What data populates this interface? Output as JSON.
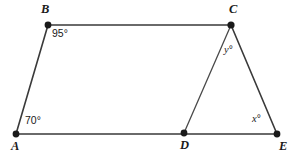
{
  "figure": {
    "background_color": "#ffffff",
    "line_color": "#3a3a3a",
    "vertex_color": "#1a1a1a",
    "width": 293,
    "height": 156
  },
  "vertices": [
    {
      "id": "A",
      "label": "A",
      "x": 16,
      "y": 134,
      "label_x": 11,
      "label_y": 140
    },
    {
      "id": "B",
      "label": "B",
      "x": 48,
      "y": 25,
      "label_x": 41,
      "label_y": 3
    },
    {
      "id": "C",
      "label": "C",
      "x": 231,
      "y": 25,
      "label_x": 229,
      "label_y": 3
    },
    {
      "id": "D",
      "label": "D",
      "x": 184,
      "y": 133,
      "label_x": 180,
      "label_y": 139
    },
    {
      "id": "E",
      "label": "E",
      "x": 277,
      "y": 134,
      "label_x": 279,
      "label_y": 140
    }
  ],
  "segments": [
    {
      "id": "AB",
      "from": "A",
      "to": "B"
    },
    {
      "id": "BC",
      "from": "B",
      "to": "C"
    },
    {
      "id": "CE",
      "from": "C",
      "to": "E"
    },
    {
      "id": "AE",
      "from": "A",
      "to": "E"
    },
    {
      "id": "CD",
      "from": "C",
      "to": "D"
    }
  ],
  "angle_labels": [
    {
      "id": "angle-B",
      "text": "95°",
      "at_vertex": "B",
      "x": 52,
      "y": 28,
      "style": "numeric"
    },
    {
      "id": "angle-A",
      "text": "70°",
      "at_vertex": "A",
      "x": 25,
      "y": 115,
      "style": "numeric"
    },
    {
      "id": "angle-C",
      "text": "y",
      "degree": "°",
      "at_vertex": "C",
      "x": 224,
      "y": 44,
      "style": "variable"
    },
    {
      "id": "angle-E",
      "text": "x",
      "degree": "°",
      "at_vertex": "E",
      "x": 252,
      "y": 113,
      "style": "variable"
    }
  ]
}
